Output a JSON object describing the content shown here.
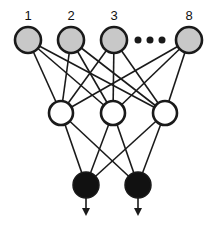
{
  "diagram": {
    "type": "neural-network",
    "colors": {
      "input_fill": "#c8c8c8",
      "hidden_fill": "#ffffff",
      "output_fill": "#111111",
      "stroke": "#1a1a1a",
      "background": "#ffffff"
    },
    "input_layer": {
      "nodes": [
        {
          "label": "1",
          "x": 28,
          "y": 40
        },
        {
          "label": "2",
          "x": 71,
          "y": 40
        },
        {
          "label": "3",
          "x": 114,
          "y": 40
        },
        {
          "label": "8",
          "x": 189,
          "y": 40
        }
      ],
      "ellipsis": [
        {
          "x": 138,
          "y": 40
        },
        {
          "x": 150,
          "y": 40
        },
        {
          "x": 162,
          "y": 40
        }
      ],
      "radius": 13
    },
    "hidden_layer": {
      "nodes": [
        {
          "x": 61,
          "y": 113
        },
        {
          "x": 113,
          "y": 113
        },
        {
          "x": 165,
          "y": 113
        }
      ],
      "radius": 12
    },
    "output_layer": {
      "nodes": [
        {
          "x": 86,
          "y": 185
        },
        {
          "x": 138,
          "y": 185
        }
      ],
      "radius": 13,
      "arrow_end_y": 216
    }
  }
}
